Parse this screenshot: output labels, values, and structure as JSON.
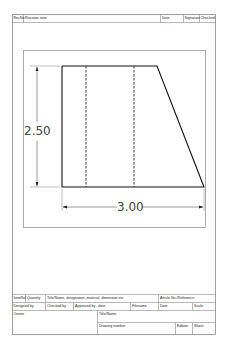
{
  "revision_block": {
    "headers": [
      "RevNo",
      "Revision note",
      "Date",
      "Signature",
      "Checked"
    ]
  },
  "drawing": {
    "dimension_height": "2.50",
    "dimension_width": "3.00",
    "line_color": "#111111",
    "frame_color": "#777777"
  },
  "title_block": {
    "row1": {
      "item_ref": "ItemRef",
      "quantity": "Quantity",
      "title": "Title/Name, designation, material, dimension etc",
      "article": "Article No./Reference"
    },
    "row2": {
      "designed_by": "Designed by",
      "checked_by": "Checked by",
      "approved_by": "Approved by - date",
      "filename": "Filename",
      "date": "Date",
      "scale": "Scale"
    },
    "row3": {
      "owner": "Owner",
      "title_name": "Title/Name"
    },
    "row4": {
      "drawing_number": "Drawing number",
      "edition": "Edition",
      "sheet": "Sheet"
    }
  }
}
